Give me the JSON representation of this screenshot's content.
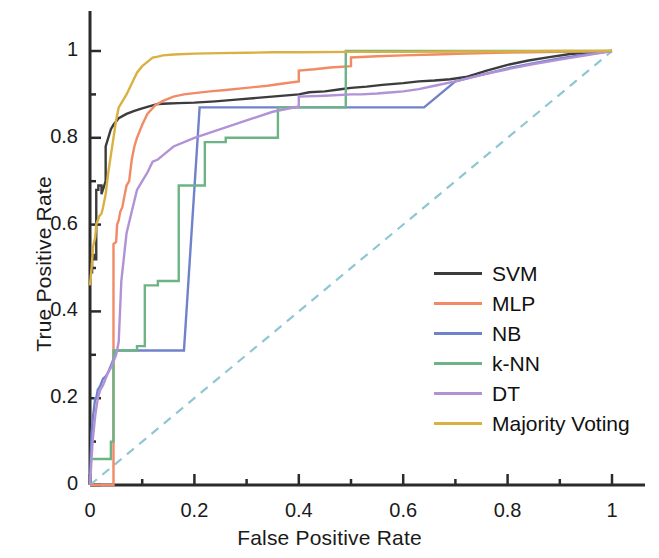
{
  "chart_data": {
    "type": "line",
    "title": "",
    "xlabel": "False Positive Rate",
    "ylabel": "True Positive Rate",
    "xlim": [
      0,
      1
    ],
    "ylim": [
      0,
      1
    ],
    "xticks": [
      "0",
      "0.2",
      "0.4",
      "0.6",
      "0.8",
      "1"
    ],
    "xtick_values": [
      0,
      0.2,
      0.4,
      0.6,
      0.8,
      1
    ],
    "yticks": [
      "0",
      "0.2",
      "0.4",
      "0.6",
      "0.8",
      "1"
    ],
    "ytick_values": [
      0,
      0.2,
      0.4,
      0.6,
      0.8,
      1
    ],
    "minor_ticks": true,
    "grid": false,
    "legend_position": "center-right",
    "reference_line": {
      "name": "chance-diagonal",
      "style": "dashed",
      "color": "#8fc6d4",
      "x": [
        0,
        1
      ],
      "y": [
        0,
        1
      ]
    },
    "series": [
      {
        "name": "SVM",
        "color": "#3c3c3c",
        "x": [
          0,
          0.004,
          0.004,
          0.008,
          0.008,
          0.012,
          0.012,
          0.016,
          0.016,
          0.022,
          0.022,
          0.03,
          0.03,
          0.04,
          0.045,
          0.055,
          0.07,
          0.085,
          0.1,
          0.115,
          0.13,
          0.15,
          0.17,
          0.2,
          0.24,
          0.28,
          0.32,
          0.36,
          0.4,
          0.42,
          0.45,
          0.48,
          0.5,
          0.53,
          0.56,
          0.6,
          0.63,
          0.66,
          0.69,
          0.72,
          0.76,
          0.8,
          0.84,
          0.88,
          0.92,
          0.96,
          1
        ],
        "y": [
          0.49,
          0.49,
          0.53,
          0.53,
          0.52,
          0.52,
          0.68,
          0.68,
          0.69,
          0.69,
          0.67,
          0.7,
          0.78,
          0.82,
          0.83,
          0.845,
          0.855,
          0.862,
          0.868,
          0.873,
          0.878,
          0.879,
          0.88,
          0.881,
          0.884,
          0.888,
          0.892,
          0.896,
          0.9,
          0.905,
          0.907,
          0.912,
          0.915,
          0.918,
          0.922,
          0.926,
          0.93,
          0.932,
          0.935,
          0.94,
          0.955,
          0.968,
          0.978,
          0.986,
          0.993,
          0.997,
          1
        ]
      },
      {
        "name": "MLP",
        "color": "#f28a66",
        "x": [
          0,
          0.045,
          0.045,
          0.05,
          0.052,
          0.055,
          0.058,
          0.062,
          0.065,
          0.07,
          0.075,
          0.08,
          0.085,
          0.09,
          0.1,
          0.11,
          0.125,
          0.14,
          0.16,
          0.18,
          0.2,
          0.23,
          0.26,
          0.3,
          0.34,
          0.37,
          0.4,
          0.4,
          0.43,
          0.46,
          0.5,
          0.5,
          0.55,
          0.6,
          0.66,
          0.72,
          0.78,
          0.84,
          0.9,
          0.95,
          1
        ],
        "y": [
          0,
          0,
          0.555,
          0.56,
          0.6,
          0.61,
          0.63,
          0.64,
          0.66,
          0.69,
          0.7,
          0.75,
          0.78,
          0.8,
          0.83,
          0.855,
          0.875,
          0.885,
          0.895,
          0.9,
          0.903,
          0.907,
          0.91,
          0.915,
          0.92,
          0.925,
          0.93,
          0.955,
          0.958,
          0.962,
          0.965,
          0.985,
          0.988,
          0.99,
          0.992,
          0.994,
          0.996,
          0.997,
          0.998,
          0.999,
          1
        ]
      },
      {
        "name": "NB",
        "color": "#7082cc",
        "x": [
          0,
          0.003,
          0.006,
          0.01,
          0.012,
          0.015,
          0.018,
          0.02,
          0.025,
          0.03,
          0.035,
          0.04,
          0.045,
          0.05,
          0.05,
          0.18,
          0.18,
          0.21,
          0.21,
          0.64,
          0.64,
          0.7,
          0.75,
          0.8,
          0.85,
          0.9,
          0.95,
          1
        ],
        "y": [
          0,
          0.12,
          0.16,
          0.2,
          0.2,
          0.22,
          0.225,
          0.23,
          0.245,
          0.25,
          0.26,
          0.275,
          0.29,
          0.31,
          0.31,
          0.31,
          0.31,
          0.87,
          0.87,
          0.87,
          0.87,
          0.93,
          0.945,
          0.96,
          0.972,
          0.983,
          0.992,
          1
        ]
      },
      {
        "name": "k-NN",
        "color": "#6cb485",
        "x": [
          0,
          0.04,
          0.04,
          0.045,
          0.045,
          0.09,
          0.09,
          0.105,
          0.105,
          0.13,
          0.13,
          0.17,
          0.17,
          0.22,
          0.22,
          0.26,
          0.26,
          0.36,
          0.36,
          0.42,
          0.42,
          0.49,
          0.49,
          0.5,
          0.5,
          0.6,
          0.7,
          0.8,
          0.9,
          1
        ],
        "y": [
          0.06,
          0.06,
          0.1,
          0.1,
          0.31,
          0.31,
          0.32,
          0.32,
          0.46,
          0.46,
          0.47,
          0.47,
          0.69,
          0.69,
          0.79,
          0.79,
          0.8,
          0.8,
          0.87,
          0.87,
          0.87,
          0.87,
          1,
          1,
          1,
          1,
          1,
          1,
          1,
          1
        ]
      },
      {
        "name": "DT",
        "color": "#b292d6",
        "x": [
          0,
          0.005,
          0.01,
          0.015,
          0.02,
          0.025,
          0.03,
          0.035,
          0.04,
          0.045,
          0.05,
          0.055,
          0.06,
          0.07,
          0.08,
          0.09,
          0.1,
          0.11,
          0.12,
          0.13,
          0.14,
          0.16,
          0.2,
          0.25,
          0.3,
          0.35,
          0.4,
          0.4,
          0.45,
          0.5,
          0.52,
          0.55,
          0.58,
          0.6,
          0.63,
          0.66,
          0.7,
          0.75,
          0.8,
          0.85,
          0.9,
          0.95,
          1
        ],
        "y": [
          0,
          0.1,
          0.16,
          0.2,
          0.22,
          0.23,
          0.245,
          0.26,
          0.27,
          0.285,
          0.3,
          0.33,
          0.47,
          0.58,
          0.63,
          0.68,
          0.7,
          0.72,
          0.745,
          0.75,
          0.76,
          0.78,
          0.8,
          0.82,
          0.84,
          0.86,
          0.872,
          0.895,
          0.897,
          0.9,
          0.9,
          0.902,
          0.905,
          0.907,
          0.912,
          0.92,
          0.93,
          0.945,
          0.958,
          0.97,
          0.98,
          0.99,
          1
        ]
      },
      {
        "name": "Majority Voting",
        "color": "#d9b142",
        "x": [
          0,
          0.003,
          0.006,
          0.01,
          0.012,
          0.015,
          0.018,
          0.022,
          0.025,
          0.03,
          0.035,
          0.04,
          0.045,
          0.05,
          0.055,
          0.06,
          0.07,
          0.08,
          0.09,
          0.1,
          0.11,
          0.12,
          0.13,
          0.14,
          0.16,
          0.2,
          0.25,
          0.3,
          0.35,
          0.4,
          0.5,
          0.6,
          0.7,
          0.8,
          0.9,
          1
        ],
        "y": [
          0.46,
          0.5,
          0.55,
          0.57,
          0.6,
          0.61,
          0.62,
          0.625,
          0.64,
          0.67,
          0.72,
          0.76,
          0.8,
          0.84,
          0.87,
          0.88,
          0.9,
          0.925,
          0.95,
          0.965,
          0.975,
          0.985,
          0.987,
          0.99,
          0.992,
          0.994,
          0.995,
          0.996,
          0.997,
          0.997,
          0.998,
          0.998,
          0.999,
          0.999,
          1,
          1
        ]
      }
    ]
  },
  "legend": {
    "items": [
      {
        "label": "SVM",
        "color": "#3c3c3c"
      },
      {
        "label": "MLP",
        "color": "#f28a66"
      },
      {
        "label": "NB",
        "color": "#7082cc"
      },
      {
        "label": "k-NN",
        "color": "#6cb485"
      },
      {
        "label": "DT",
        "color": "#b292d6"
      },
      {
        "label": "Majority Voting",
        "color": "#d9b142"
      }
    ]
  },
  "axes": {
    "x_title": "False Positive Rate",
    "y_title": "True Positive Rate",
    "x_tick_labels": [
      "0",
      "0.2",
      "0.4",
      "0.6",
      "0.8",
      "1"
    ],
    "y_tick_labels": [
      "0",
      "0.2",
      "0.4",
      "0.6",
      "0.8",
      "1"
    ],
    "axis_color": "#2b2b2b"
  }
}
